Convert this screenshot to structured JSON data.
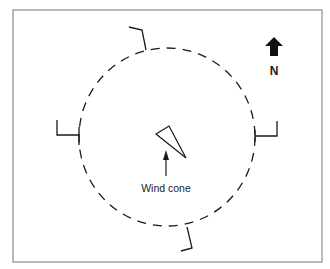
{
  "diagram": {
    "type": "wind-cone-site-plan",
    "colors": {
      "stroke": "#1a1a1a",
      "frame": "#8a8a8a",
      "background": "#ffffff"
    },
    "north_indicator": {
      "label": "N",
      "icon": "north-arrow-icon"
    },
    "circle": {
      "style": "dashed",
      "cx": 167,
      "cy": 137,
      "rx": 88,
      "ry": 90
    },
    "wind_cone": {
      "label": "Wind cone",
      "icon": "wind-cone-triangle-icon",
      "pointer": "up-arrow-icon"
    },
    "markers": [
      {
        "id": "top",
        "position": "north"
      },
      {
        "id": "right",
        "position": "east"
      },
      {
        "id": "bottom",
        "position": "south"
      },
      {
        "id": "left",
        "position": "west"
      }
    ]
  }
}
